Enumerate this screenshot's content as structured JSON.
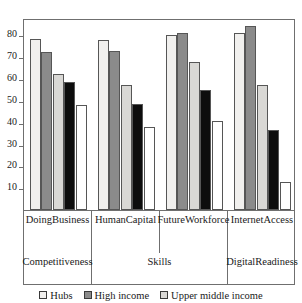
{
  "title": "",
  "chart_data": {
    "type": "bar",
    "title": "",
    "subtitle": "",
    "xlabel": "",
    "ylabel": "",
    "ylim": [
      0,
      88
    ],
    "yticks": [
      10,
      20,
      30,
      40,
      50,
      60,
      70,
      80
    ],
    "grid": false,
    "legend_position": "bottom",
    "categories": [
      "Doing Business",
      "Human Capital",
      "Future Workforce",
      "Internet Access"
    ],
    "category_lines": [
      [
        "Doing",
        "Business"
      ],
      [
        "Human",
        "Capital"
      ],
      [
        "Future",
        "Workforce"
      ],
      [
        "Internet",
        "Access"
      ]
    ],
    "groups": [
      {
        "label": "Competitiveness",
        "lines": [
          "Competitiveness"
        ],
        "span": 1
      },
      {
        "label": "Skills",
        "lines": [
          "Skills"
        ],
        "span": 2
      },
      {
        "label": "Digital Readiness",
        "lines": [
          "Digital",
          "Readiness"
        ],
        "span": 1
      }
    ],
    "series": [
      {
        "name": "Hubs",
        "color": "#f1f0ee",
        "values": [
          78.5,
          78.0,
          80.0,
          81.0
        ]
      },
      {
        "name": "High income",
        "color": "#8b8b8b",
        "values": [
          72.5,
          73.0,
          81.0,
          84.5
        ]
      },
      {
        "name": "Upper middle income",
        "color": "#d9d8d5",
        "values": [
          62.5,
          57.5,
          68.0,
          57.5
        ]
      },
      {
        "name": "Lower middle income",
        "color": "#0d0d0d",
        "values": [
          58.5,
          48.5,
          55.0,
          36.5
        ]
      },
      {
        "name": "Low income",
        "color": "#ffffff",
        "values": [
          48.0,
          38.0,
          41.0,
          13.0
        ]
      }
    ],
    "legend_entries": [
      {
        "label": "Hubs",
        "color": "#f1f0ee"
      },
      {
        "label": "High income",
        "color": "#8b8b8b"
      },
      {
        "label": "Upper middle income",
        "color": "#d9d8d5"
      }
    ]
  }
}
